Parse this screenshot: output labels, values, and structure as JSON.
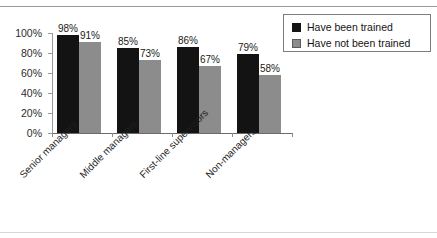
{
  "chart_data": {
    "type": "bar",
    "title": "",
    "subtitle": "",
    "xlabel": "",
    "ylabel": "",
    "ylim": [
      0,
      100
    ],
    "yticks": [
      "0%",
      "20%",
      "40%",
      "60%",
      "80%",
      "100%"
    ],
    "grid": false,
    "legend_position": "top-right",
    "categories": [
      "Senior managers",
      "Middle managers",
      "First-line supervisors",
      "Non-managers"
    ],
    "series": [
      {
        "name": "Have been trained",
        "color": "#131313",
        "values": [
          98,
          85,
          86,
          79
        ],
        "labels": [
          "98%",
          "85%",
          "86%",
          "79%"
        ]
      },
      {
        "name": "Have not been trained",
        "color": "#8c8c8c",
        "values": [
          91,
          73,
          67,
          58
        ],
        "labels": [
          "91%",
          "73%",
          "67%",
          "58%"
        ]
      }
    ]
  },
  "legend": {
    "items": [
      {
        "label": "Have been trained"
      },
      {
        "label": "Have not been trained"
      }
    ]
  }
}
